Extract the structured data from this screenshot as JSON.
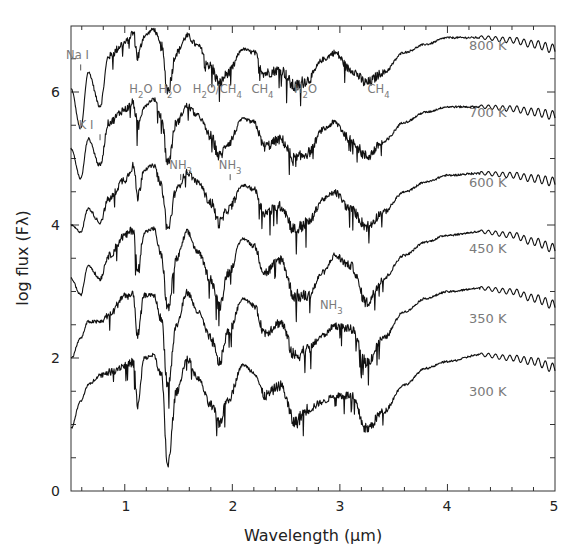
{
  "chart_data": {
    "type": "line",
    "title": "",
    "xlabel": "Wavelength (μm)",
    "ylabel": "log flux (Fλ)",
    "xlim": [
      0.5,
      5
    ],
    "ylim": [
      0,
      7.0
    ],
    "grid": false,
    "xticks": [
      1,
      2,
      3,
      4,
      5
    ],
    "yticks": [
      0,
      2,
      4,
      6
    ],
    "x_minor_step": 0.2,
    "y_minor_step": 0.5,
    "series": [
      {
        "name": "800 K",
        "label": "800 K",
        "label_pos": [
          4.2,
          6.7
        ],
        "anchors": [
          [
            0.5,
            6.05
          ],
          [
            0.59,
            5.45
          ],
          [
            0.66,
            6.3
          ],
          [
            0.77,
            5.8
          ],
          [
            0.85,
            6.55
          ],
          [
            1.0,
            6.75
          ],
          [
            1.08,
            6.9
          ],
          [
            1.12,
            6.55
          ],
          [
            1.18,
            6.85
          ],
          [
            1.27,
            6.95
          ],
          [
            1.34,
            6.7
          ],
          [
            1.4,
            6.05
          ],
          [
            1.48,
            6.6
          ],
          [
            1.58,
            6.85
          ],
          [
            1.68,
            6.7
          ],
          [
            1.8,
            6.4
          ],
          [
            1.88,
            6.15
          ],
          [
            1.96,
            6.3
          ],
          [
            2.1,
            6.65
          ],
          [
            2.2,
            6.6
          ],
          [
            2.3,
            6.3
          ],
          [
            2.45,
            6.35
          ],
          [
            2.58,
            6.1
          ],
          [
            2.7,
            6.2
          ],
          [
            2.85,
            6.5
          ],
          [
            2.95,
            6.6
          ],
          [
            3.1,
            6.35
          ],
          [
            3.25,
            6.15
          ],
          [
            3.4,
            6.3
          ],
          [
            3.6,
            6.6
          ],
          [
            3.8,
            6.72
          ],
          [
            4.0,
            6.82
          ],
          [
            4.3,
            6.82
          ],
          [
            4.6,
            6.78
          ],
          [
            4.8,
            6.72
          ],
          [
            5.0,
            6.65
          ]
        ]
      },
      {
        "name": "700 K",
        "label": "700 K",
        "label_pos": [
          4.2,
          5.7
        ],
        "anchors": [
          [
            0.5,
            5.15
          ],
          [
            0.59,
            4.7
          ],
          [
            0.66,
            5.3
          ],
          [
            0.77,
            4.9
          ],
          [
            0.85,
            5.55
          ],
          [
            1.0,
            5.75
          ],
          [
            1.08,
            5.85
          ],
          [
            1.12,
            5.5
          ],
          [
            1.18,
            5.8
          ],
          [
            1.27,
            5.9
          ],
          [
            1.34,
            5.65
          ],
          [
            1.4,
            4.95
          ],
          [
            1.48,
            5.55
          ],
          [
            1.58,
            5.8
          ],
          [
            1.68,
            5.65
          ],
          [
            1.8,
            5.35
          ],
          [
            1.88,
            5.05
          ],
          [
            1.96,
            5.25
          ],
          [
            2.1,
            5.6
          ],
          [
            2.2,
            5.55
          ],
          [
            2.3,
            5.2
          ],
          [
            2.45,
            5.3
          ],
          [
            2.58,
            5.0
          ],
          [
            2.7,
            5.1
          ],
          [
            2.85,
            5.45
          ],
          [
            2.95,
            5.55
          ],
          [
            3.1,
            5.3
          ],
          [
            3.25,
            5.05
          ],
          [
            3.4,
            5.25
          ],
          [
            3.6,
            5.55
          ],
          [
            3.8,
            5.7
          ],
          [
            4.0,
            5.78
          ],
          [
            4.3,
            5.78
          ],
          [
            4.6,
            5.75
          ],
          [
            4.8,
            5.7
          ],
          [
            5.0,
            5.65
          ]
        ]
      },
      {
        "name": "600 K",
        "label": "600 K",
        "label_pos": [
          4.2,
          4.65
        ],
        "anchors": [
          [
            0.5,
            4.0
          ],
          [
            0.59,
            3.9
          ],
          [
            0.66,
            4.25
          ],
          [
            0.77,
            4.05
          ],
          [
            0.85,
            4.4
          ],
          [
            1.0,
            4.7
          ],
          [
            1.08,
            4.9
          ],
          [
            1.12,
            4.45
          ],
          [
            1.18,
            4.85
          ],
          [
            1.27,
            4.9
          ],
          [
            1.34,
            4.6
          ],
          [
            1.4,
            3.95
          ],
          [
            1.48,
            4.55
          ],
          [
            1.58,
            4.8
          ],
          [
            1.68,
            4.65
          ],
          [
            1.8,
            4.35
          ],
          [
            1.88,
            4.05
          ],
          [
            1.96,
            4.25
          ],
          [
            2.1,
            4.6
          ],
          [
            2.2,
            4.55
          ],
          [
            2.3,
            4.2
          ],
          [
            2.45,
            4.3
          ],
          [
            2.58,
            3.95
          ],
          [
            2.7,
            4.05
          ],
          [
            2.85,
            4.4
          ],
          [
            2.95,
            4.5
          ],
          [
            3.1,
            4.25
          ],
          [
            3.25,
            4.0
          ],
          [
            3.4,
            4.2
          ],
          [
            3.6,
            4.5
          ],
          [
            3.8,
            4.65
          ],
          [
            4.0,
            4.75
          ],
          [
            4.3,
            4.78
          ],
          [
            4.6,
            4.75
          ],
          [
            4.8,
            4.7
          ],
          [
            5.0,
            4.65
          ]
        ]
      },
      {
        "name": "450 K",
        "label": "450 K",
        "label_pos": [
          4.2,
          3.65
        ],
        "anchors": [
          [
            0.5,
            3.2
          ],
          [
            0.59,
            2.95
          ],
          [
            0.66,
            3.4
          ],
          [
            0.77,
            3.2
          ],
          [
            0.85,
            3.55
          ],
          [
            1.0,
            3.85
          ],
          [
            1.08,
            3.95
          ],
          [
            1.12,
            3.3
          ],
          [
            1.18,
            3.9
          ],
          [
            1.27,
            3.95
          ],
          [
            1.34,
            3.55
          ],
          [
            1.4,
            2.75
          ],
          [
            1.48,
            3.5
          ],
          [
            1.58,
            3.9
          ],
          [
            1.68,
            3.6
          ],
          [
            1.8,
            3.2
          ],
          [
            1.88,
            2.8
          ],
          [
            1.96,
            3.3
          ],
          [
            2.1,
            3.8
          ],
          [
            2.2,
            3.7
          ],
          [
            2.3,
            3.3
          ],
          [
            2.45,
            3.5
          ],
          [
            2.58,
            2.95
          ],
          [
            2.7,
            2.95
          ],
          [
            2.85,
            3.3
          ],
          [
            2.95,
            3.55
          ],
          [
            3.1,
            3.4
          ],
          [
            3.25,
            2.85
          ],
          [
            3.4,
            3.2
          ],
          [
            3.6,
            3.55
          ],
          [
            3.8,
            3.75
          ],
          [
            4.0,
            3.85
          ],
          [
            4.3,
            3.9
          ],
          [
            4.6,
            3.85
          ],
          [
            4.8,
            3.75
          ],
          [
            5.0,
            3.65
          ]
        ]
      },
      {
        "name": "350 K",
        "label": "350 K",
        "label_pos": [
          4.2,
          2.6
        ],
        "anchors": [
          [
            0.5,
            2.0
          ],
          [
            0.59,
            2.3
          ],
          [
            0.66,
            2.55
          ],
          [
            0.77,
            2.55
          ],
          [
            0.85,
            2.65
          ],
          [
            1.0,
            2.95
          ],
          [
            1.08,
            2.95
          ],
          [
            1.12,
            2.35
          ],
          [
            1.18,
            2.95
          ],
          [
            1.27,
            2.95
          ],
          [
            1.34,
            2.6
          ],
          [
            1.4,
            1.6
          ],
          [
            1.48,
            2.5
          ],
          [
            1.58,
            3.0
          ],
          [
            1.68,
            2.7
          ],
          [
            1.8,
            2.3
          ],
          [
            1.88,
            1.95
          ],
          [
            1.96,
            2.4
          ],
          [
            2.1,
            2.9
          ],
          [
            2.2,
            2.8
          ],
          [
            2.3,
            2.4
          ],
          [
            2.45,
            2.55
          ],
          [
            2.58,
            2.05
          ],
          [
            2.7,
            2.15
          ],
          [
            2.85,
            2.35
          ],
          [
            2.95,
            2.5
          ],
          [
            3.1,
            2.45
          ],
          [
            3.25,
            1.95
          ],
          [
            3.4,
            2.3
          ],
          [
            3.6,
            2.7
          ],
          [
            3.8,
            2.9
          ],
          [
            4.0,
            3.0
          ],
          [
            4.3,
            3.05
          ],
          [
            4.6,
            3.0
          ],
          [
            4.8,
            2.9
          ],
          [
            5.0,
            2.8
          ]
        ]
      },
      {
        "name": "300 K",
        "label": "300 K",
        "label_pos": [
          4.2,
          1.5
        ],
        "anchors": [
          [
            0.5,
            0.95
          ],
          [
            0.59,
            1.35
          ],
          [
            0.66,
            1.6
          ],
          [
            0.77,
            1.75
          ],
          [
            0.85,
            1.8
          ],
          [
            1.0,
            1.9
          ],
          [
            1.08,
            1.95
          ],
          [
            1.12,
            1.3
          ],
          [
            1.18,
            2.0
          ],
          [
            1.27,
            2.05
          ],
          [
            1.34,
            1.75
          ],
          [
            1.4,
            0.4
          ],
          [
            1.48,
            1.5
          ],
          [
            1.58,
            2.0
          ],
          [
            1.68,
            1.7
          ],
          [
            1.8,
            1.3
          ],
          [
            1.88,
            1.05
          ],
          [
            1.96,
            1.4
          ],
          [
            2.1,
            1.9
          ],
          [
            2.2,
            1.8
          ],
          [
            2.3,
            1.45
          ],
          [
            2.45,
            1.6
          ],
          [
            2.58,
            1.05
          ],
          [
            2.7,
            1.25
          ],
          [
            2.85,
            1.35
          ],
          [
            2.95,
            1.45
          ],
          [
            3.1,
            1.45
          ],
          [
            3.25,
            0.95
          ],
          [
            3.4,
            1.2
          ],
          [
            3.6,
            1.6
          ],
          [
            3.8,
            1.85
          ],
          [
            4.0,
            1.95
          ],
          [
            4.3,
            2.05
          ],
          [
            4.6,
            2.0
          ],
          [
            4.8,
            1.95
          ],
          [
            5.0,
            1.85
          ]
        ]
      }
    ],
    "annotations": [
      {
        "text": "Na I",
        "x": 0.56,
        "y": 6.55,
        "marker_x": 0.59
      },
      {
        "text": "K I",
        "x": 0.64,
        "y": 5.5,
        "marker_x": 0.77
      },
      {
        "text": "H2O",
        "x": 1.15,
        "y": 6.05
      },
      {
        "text": "H2O",
        "x": 1.42,
        "y": 6.05
      },
      {
        "text": "H2O/CH4",
        "x": 1.86,
        "y": 6.05
      },
      {
        "text": "CH4",
        "x": 2.28,
        "y": 6.05
      },
      {
        "text": "H2O",
        "x": 2.68,
        "y": 6.05
      },
      {
        "text": "CH4",
        "x": 3.36,
        "y": 6.05
      },
      {
        "text": "NH3",
        "x": 1.52,
        "y": 4.9,
        "marker_x": 1.52
      },
      {
        "text": "NH3",
        "x": 1.98,
        "y": 4.9,
        "marker_x": 1.98
      },
      {
        "text": "NH3",
        "x": 2.92,
        "y": 2.8
      }
    ]
  },
  "labels": {
    "xlabel": "Wavelength (μm)",
    "ylabel": "log flux (Fλ)",
    "xtick_1": "1",
    "xtick_2": "2",
    "xtick_3": "3",
    "xtick_4": "4",
    "xtick_5": "5",
    "ytick_0": "0",
    "ytick_2": "2",
    "ytick_4": "4",
    "ytick_6": "6"
  }
}
